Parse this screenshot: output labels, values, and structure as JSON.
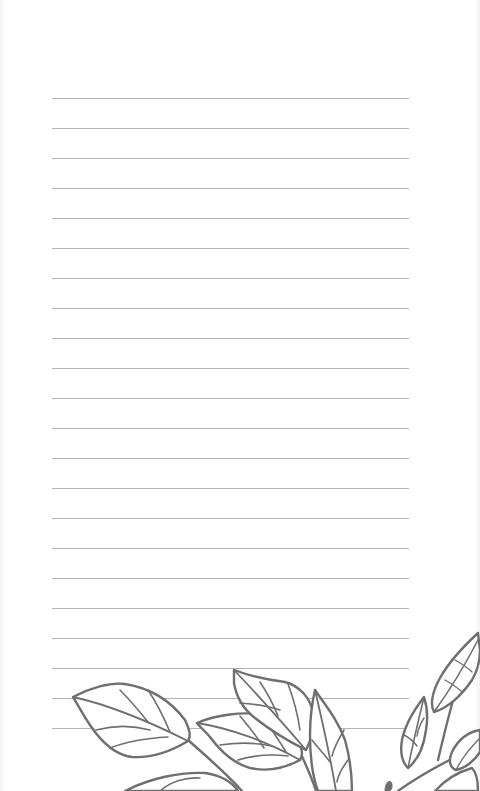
{
  "page": {
    "type": "lined-notepaper",
    "background_color": "#ffffff",
    "line_color": "#b4b4b4",
    "line_count": 22,
    "line_left": 52,
    "line_right": 409,
    "first_line_y": 98,
    "line_spacing": 30
  },
  "illustration": {
    "subject": "leaf-branches",
    "position": "bottom",
    "stroke_color": "#6f6f6f"
  }
}
